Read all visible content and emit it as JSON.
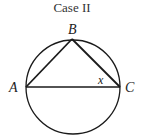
{
  "title": "Case II",
  "labels": {
    "a": "A",
    "b": "B",
    "c": "C",
    "angle": "x"
  },
  "geometry": {
    "circle": {
      "cx": 73,
      "cy": 87,
      "r": 47
    },
    "points": {
      "A": [
        26,
        87
      ],
      "B": [
        72,
        39
      ],
      "C": [
        120,
        87
      ]
    },
    "segments": [
      [
        "A",
        "B"
      ],
      [
        "B",
        "C"
      ],
      [
        "A",
        "C"
      ]
    ],
    "angle_label_at": "C"
  },
  "colors": {
    "stroke": "#1a1a1a",
    "text": "#222222"
  }
}
